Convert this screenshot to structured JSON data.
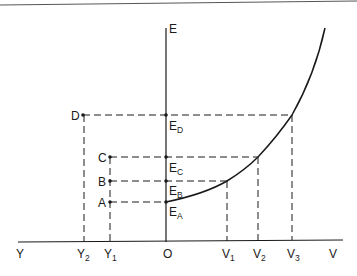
{
  "diagram": {
    "type": "energy-velocity graph with horizontal left axis",
    "axes": {
      "vertical_label": "E",
      "horizontal_right_label": "V",
      "horizontal_left_label": "Y",
      "origin_label": "O"
    },
    "points": [
      {
        "label": "D",
        "e_label": "E",
        "e_sub": "D"
      },
      {
        "label": "C",
        "e_label": "E",
        "e_sub": "C"
      },
      {
        "label": "B",
        "e_label": "E",
        "e_sub": "B"
      },
      {
        "label": "A",
        "e_label": "E",
        "e_sub": "A"
      }
    ],
    "x_ticks_right": [
      {
        "main": "V",
        "sub": "1"
      },
      {
        "main": "V",
        "sub": "2"
      },
      {
        "main": "V",
        "sub": "3"
      }
    ],
    "x_ticks_left": [
      {
        "main": "Y",
        "sub": "2"
      },
      {
        "main": "Y",
        "sub": "1"
      }
    ],
    "curve": "monotonically increasing convex curve starting at E_A on the E axis",
    "colors": {
      "ink": "#1a1a1a",
      "background": "#ffffff"
    }
  }
}
